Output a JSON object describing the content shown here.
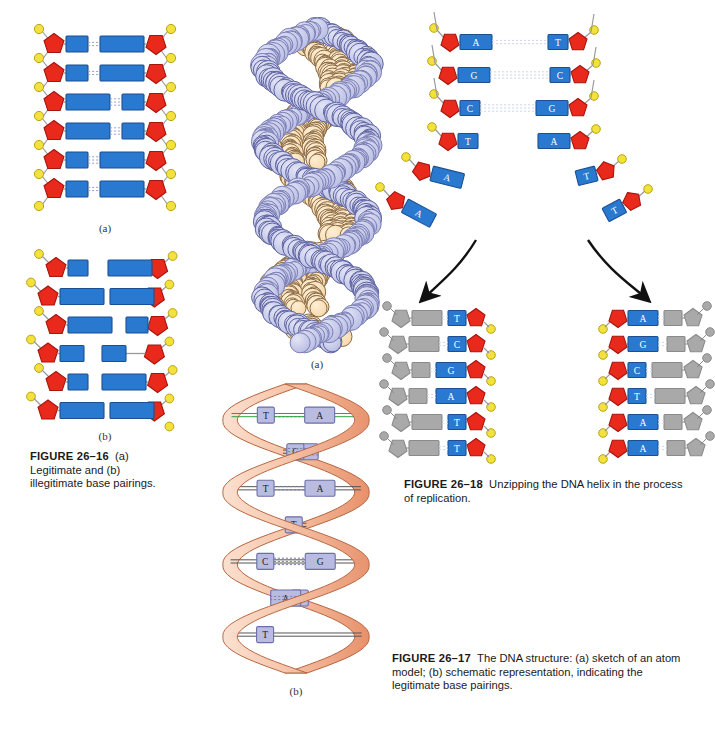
{
  "page": {
    "background": "#ffffff",
    "width": 715,
    "height": 734
  },
  "palette": {
    "sugar_red": "#e8291c",
    "sugar_red_dark": "#a8150c",
    "base_blue": "#2a79d0",
    "base_blue_dark": "#1b4f92",
    "phosphate_yellow": "#f3e13c",
    "phosphate_yellow_dark": "#b9a513",
    "ghost_gray": "#a9a9a9",
    "ghost_gray_dark": "#8a8a8a",
    "ribbon_peach": "#f6c3a6",
    "ribbon_peach_dark": "#e8906a",
    "helix_base_lavender": "#b9bce0",
    "helix_base_lavender_dark": "#6b6fa8",
    "atom_lavender": "#b9bde3",
    "atom_lavender_light": "#e3e5f5",
    "atom_peach": "#f7d9ab",
    "atom_peach_light": "#fdeed4",
    "bond_gray": "#9a9a9a",
    "arrow_black": "#111111"
  },
  "figure_26_16": {
    "id": "figure-26-16",
    "panel_a_label": "(a)",
    "panel_b_label": "(b)",
    "caption_number": "FIGURE 26–16",
    "caption_text": "(a) Legitimate and (b) illegitimate base pairings.",
    "caption_full": "FIGURE 26–16   (a) Legitimate and (b) illegitimate base pairings.",
    "panel_a": {
      "description": "Legitimate base pairings: purine-pyrimidine pairs of uniform total width, joined by hydrogen bonds.",
      "rows": [
        {
          "left_width": 22,
          "right_width": 44,
          "bonds": 2,
          "paired": true
        },
        {
          "left_width": 22,
          "right_width": 44,
          "bonds": 2,
          "paired": true
        },
        {
          "left_width": 44,
          "right_width": 22,
          "bonds": 3,
          "paired": true
        },
        {
          "left_width": 44,
          "right_width": 22,
          "bonds": 3,
          "paired": true
        },
        {
          "left_width": 22,
          "right_width": 44,
          "bonds": 3,
          "paired": true
        },
        {
          "left_width": 22,
          "right_width": 44,
          "bonds": 2,
          "paired": true
        }
      ]
    },
    "panel_b": {
      "description": "Illegitimate base pairings: purine-purine and pyrimidine-pyrimidine pairs that are too wide or too narrow, leaving gaps with no hydrogen bonds.",
      "rows": [
        {
          "left_width": 20,
          "right_width": 44,
          "gap": 20,
          "paired": false
        },
        {
          "left_width": 44,
          "right_width": 44,
          "gap": 6,
          "paired": false
        },
        {
          "left_width": 44,
          "right_width": 22,
          "gap": 14,
          "paired": false
        },
        {
          "left_width": 24,
          "right_width": 24,
          "gap": 18,
          "paired": false
        },
        {
          "left_width": 20,
          "right_width": 44,
          "gap": 14,
          "paired": false
        },
        {
          "left_width": 44,
          "right_width": 44,
          "gap": 6,
          "paired": false
        }
      ]
    }
  },
  "figure_26_17": {
    "id": "figure-26-17",
    "panel_a_label": "(a)",
    "panel_b_label": "(b)",
    "panel_a_description": "Space-filling atom model of the DNA double helix, lavender backbone atoms with peach base-pair atoms in the core.",
    "caption_number": "FIGURE 26–17",
    "caption_text": "The DNA structure: (a) sketch of an atom model; (b) schematic representation, indicating the legitimate base pairings.",
    "caption_full": "FIGURE 26–17   The DNA structure: (a) sketch of an atom model; (b) schematic representation, indicating the legitimate base pairings.",
    "helix_pairs": [
      {
        "left": "T",
        "right": "A",
        "bonds": 2,
        "highlight": true
      },
      {
        "left": "G",
        "right": "C",
        "bonds": 3,
        "highlight": false
      },
      {
        "left": "T",
        "right": "A",
        "bonds": 2,
        "highlight": false
      },
      {
        "left": "",
        "right": "T",
        "bonds": 2,
        "highlight": false
      },
      {
        "left": "C",
        "right": "G",
        "bonds": 3,
        "highlight": false
      },
      {
        "left": "T",
        "right": "A",
        "bonds": 2,
        "highlight": false
      },
      {
        "left": "T",
        "right": "",
        "bonds": 2,
        "highlight": false
      }
    ]
  },
  "figure_26_18": {
    "id": "figure-26-18",
    "caption_number": "FIGURE 26–18",
    "caption_text": "Unzipping the DNA helix in the process of replication.",
    "caption_full": "FIGURE 26–18   Unzipping the DNA helix in the process of replication.",
    "parent_helix": {
      "paired_rows": [
        {
          "left": "A",
          "right": "T",
          "bonds": 2
        },
        {
          "left": "G",
          "right": "C",
          "bonds": 3
        },
        {
          "left": "C",
          "right": "G",
          "bonds": 3
        }
      ],
      "separated_rows": [
        {
          "left": "T",
          "right": "A"
        },
        {
          "left": "A",
          "right": "T"
        },
        {
          "left": "A",
          "right": "T"
        }
      ]
    },
    "daughter_left": {
      "description": "New strand synthesized on the left template; gray shapes are the newly added complementary nucleotides.",
      "bases": [
        "T",
        "C",
        "G",
        "A",
        "T",
        "T"
      ]
    },
    "daughter_right": {
      "description": "New strand synthesized on the right template; gray shapes are the newly added complementary nucleotides.",
      "bases": [
        "A",
        "G",
        "C",
        "T",
        "A",
        "A"
      ]
    },
    "arrow_left_name": "replication-arrow-left",
    "arrow_right_name": "replication-arrow-right"
  }
}
